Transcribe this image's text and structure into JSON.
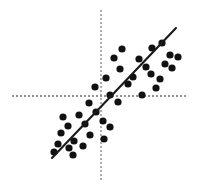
{
  "figure": {
    "title": "",
    "background_color": "#ffffff",
    "width": 204,
    "height": 187
  },
  "axes": {
    "x_axis": {
      "name": "horizontal-axis",
      "style": "dotted",
      "color": "#2b2b2b",
      "y_position": 96,
      "x_start": 12,
      "x_end": 187,
      "dash": "2,2",
      "width": 1.2,
      "label": "",
      "tick_labels": []
    },
    "y_axis": {
      "name": "vertical-axis",
      "style": "dotted",
      "color": "#8a8a8a",
      "x_position": 101,
      "y_start": 10,
      "y_end": 182,
      "dash": "2,2",
      "width": 1.4,
      "label": "",
      "tick_labels": []
    }
  },
  "trendline": {
    "color": "#1a1a1a",
    "width": 2.1,
    "x1": 52,
    "y1": 158,
    "x2": 176,
    "y2": 28,
    "label": ""
  },
  "chart_data": {
    "type": "scatter",
    "title": "",
    "subtitle": "",
    "xlabel": "",
    "ylabel": "",
    "xlim": [
      0,
      204
    ],
    "ylim": [
      187,
      0
    ],
    "grid": false,
    "legend": [],
    "annotations": [],
    "origin_px": {
      "x": 101,
      "y": 96
    },
    "correlation": "positive",
    "marker": {
      "shape": "circle",
      "color": "#111111",
      "radius": 3.6
    },
    "series": [
      {
        "name": "observations",
        "color": "#111111",
        "points_px": [
          [
            122,
            49
          ],
          [
            152,
            48
          ],
          [
            162,
            43
          ],
          [
            114,
            58
          ],
          [
            139,
            59
          ],
          [
            170,
            55
          ],
          [
            178,
            57
          ],
          [
            120,
            69
          ],
          [
            146,
            67
          ],
          [
            165,
            64
          ],
          [
            172,
            68
          ],
          [
            106,
            78
          ],
          [
            133,
            77
          ],
          [
            151,
            74
          ],
          [
            160,
            79
          ],
          [
            95,
            87
          ],
          [
            128,
            84
          ],
          [
            156,
            88
          ],
          [
            110,
            95
          ],
          [
            142,
            95
          ],
          [
            89,
            103
          ],
          [
            118,
            102
          ],
          [
            63,
            117
          ],
          [
            79,
            115
          ],
          [
            96,
            112
          ],
          [
            103,
            121
          ],
          [
            68,
            126
          ],
          [
            85,
            124
          ],
          [
            110,
            127
          ],
          [
            61,
            133
          ],
          [
            90,
            135
          ],
          [
            104,
            139
          ],
          [
            74,
            141
          ],
          [
            58,
            144
          ],
          [
            83,
            146
          ],
          [
            69,
            148
          ],
          [
            54,
            152
          ],
          [
            73,
            155
          ]
        ]
      }
    ]
  }
}
